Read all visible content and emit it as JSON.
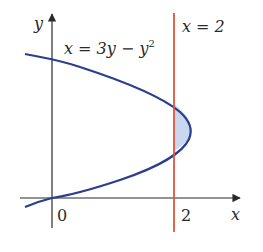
{
  "figure": {
    "axes": {
      "x_label": "x",
      "y_label": "y",
      "origin_label": "0",
      "x_tick_label": "2"
    },
    "curve": {
      "equation_lhs": "x = 3y − y",
      "equation_exp": "2",
      "color": "#2b3d8f"
    },
    "line": {
      "equation": "x = 2",
      "color": "#e0553a"
    },
    "region": {
      "fill": "#c9d8ee",
      "description": "region bounded by x = 2 and x = 3y − y² (right of x = 2)"
    }
  }
}
